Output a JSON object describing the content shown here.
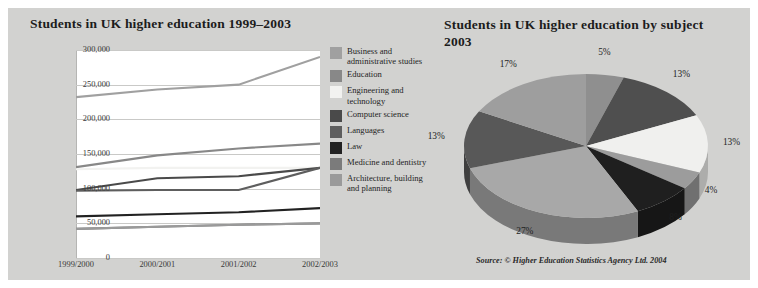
{
  "figure": {
    "background": "#d2d2d0"
  },
  "line_chart": {
    "title": "Students in UK higher education 1999–2003",
    "y_ticks": [
      "300,000",
      "250,000",
      "200,000",
      "150,000",
      "100,000",
      "50,000",
      "0"
    ],
    "x_ticks": [
      "1999/2000",
      "2000/2001",
      "2001/2002",
      "2002/2003"
    ],
    "legend": [
      {
        "label": "Business and administrative studies",
        "color": "#a0a0a0"
      },
      {
        "label": "Education",
        "color": "#888888"
      },
      {
        "label": "Engineering and technology",
        "color": "#f2f2f0"
      },
      {
        "label": "Computer science",
        "color": "#4a4a4a"
      },
      {
        "label": "Languages",
        "color": "#5e5e5e"
      },
      {
        "label": "Law",
        "color": "#222222"
      },
      {
        "label": "Medicine and dentistry",
        "color": "#7b7b7b"
      },
      {
        "label": "Architecture, building and planning",
        "color": "#9a9a9a"
      }
    ]
  },
  "pie_chart": {
    "title": "Students in UK higher education by subject 2003",
    "source": "Source: © Higher Education Statistics Agency Ltd. 2004"
  },
  "chart_data": [
    {
      "type": "line",
      "title": "Students in UK higher education 1999–2003",
      "xlabel": "",
      "ylabel": "",
      "categories": [
        "1999/2000",
        "2000/2001",
        "2001/2002",
        "2002/2003"
      ],
      "ylim": [
        0,
        300000
      ],
      "ytick_step": 50000,
      "grid": true,
      "legend_position": "right",
      "series": [
        {
          "name": "Business and administrative studies",
          "color": "#a0a0a0",
          "values": [
            232000,
            243000,
            250000,
            290000
          ]
        },
        {
          "name": "Education",
          "color": "#888888",
          "values": [
            131000,
            148000,
            158000,
            165000
          ]
        },
        {
          "name": "Engineering and technology",
          "color": "#f2f2f0",
          "values": [
            128000,
            130000,
            130000,
            130000
          ]
        },
        {
          "name": "Computer science",
          "color": "#4a4a4a",
          "values": [
            98000,
            115000,
            118000,
            130000
          ]
        },
        {
          "name": "Languages",
          "color": "#5e5e5e",
          "values": [
            97000,
            98000,
            98000,
            130000
          ]
        },
        {
          "name": "Law",
          "color": "#222222",
          "values": [
            60000,
            63000,
            66000,
            72000
          ]
        },
        {
          "name": "Medicine and dentistry",
          "color": "#7b7b7b",
          "values": [
            42000,
            45000,
            48000,
            50000
          ]
        },
        {
          "name": "Architecture, building and planning",
          "color": "#9a9a9a",
          "values": [
            42000,
            45000,
            48000,
            50000
          ]
        }
      ]
    },
    {
      "type": "pie",
      "title": "Students in UK higher education by subject 2003",
      "labels": [
        "5%",
        "13%",
        "13%",
        "4%",
        "8%",
        "27%",
        "13%",
        "17%"
      ],
      "values": [
        5,
        13,
        13,
        4,
        8,
        27,
        13,
        17
      ],
      "colors": [
        "#8f8f8f",
        "#4f4f4f",
        "#f0f0ee",
        "#9c9c9c",
        "#1f1f1f",
        "#a8a8a8",
        "#585858",
        "#9e9e9e"
      ],
      "start_angle": 0,
      "direction": "clockwise",
      "source": "Source: © Higher Education Statistics Agency Ltd. 2004"
    }
  ]
}
